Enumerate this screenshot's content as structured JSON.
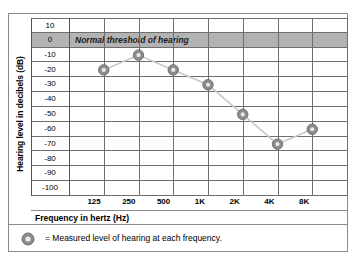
{
  "chart_data": {
    "type": "line",
    "title": "",
    "xlabel": "Frequency in hertz (Hz)",
    "ylabel": "Hearing level in decibels (dB)",
    "categories": [
      "125",
      "250",
      "500",
      "1K",
      "2K",
      "4K",
      "8K"
    ],
    "values": [
      -20,
      -10,
      -20,
      -30,
      -50,
      -70,
      -60
    ],
    "series": [
      {
        "name": "Measured level of hearing",
        "values": [
          -20,
          -10,
          -20,
          -30,
          -50,
          -70,
          -60
        ]
      }
    ],
    "ylim": [
      -105,
      15
    ],
    "ytick_labels": [
      "10",
      "0",
      "-10",
      "-20",
      "-30",
      "-40",
      "-50",
      "-60",
      "-70",
      "-80",
      "-90",
      "-100"
    ],
    "ytick_values": [
      10,
      0,
      -10,
      -20,
      -30,
      -40,
      -50,
      -60,
      -70,
      -80,
      -90,
      -100
    ],
    "grid": true,
    "legend_position": "bottom",
    "annotations": [
      {
        "text": "Normal threshold of hearing",
        "value": 0,
        "style": "shaded-band"
      }
    ],
    "colors": {
      "band_fill": "#b3b3b3",
      "grid_line": "#6e6e6e",
      "border": "#8a8a8a",
      "marker_fill": "#8c8c8c",
      "marker_inner": "#e8e8e8",
      "data_line": "#c9c9c9",
      "text": "#000000"
    }
  },
  "axis": {
    "y_title": "Hearing level in decibels (dB)",
    "x_title": "Frequency in hertz (Hz)",
    "y_labels": [
      "10",
      "0",
      "-10",
      "-20",
      "-30",
      "-40",
      "-50",
      "-60",
      "-70",
      "-80",
      "-90",
      "-100"
    ],
    "x_labels": [
      "125",
      "250",
      "500",
      "1K",
      "2K",
      "4K",
      "8K"
    ]
  },
  "band": {
    "label": "Normal threshold of hearing"
  },
  "legend": {
    "marker_name": "measured-level-marker",
    "text": "= Measured level of hearing at each frequency."
  }
}
